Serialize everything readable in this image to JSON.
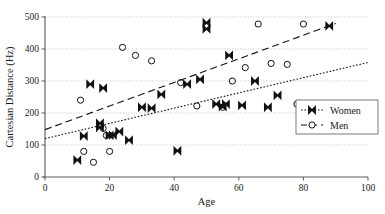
{
  "chart_data": {
    "type": "scatter",
    "title": "",
    "xlabel": "Age",
    "ylabel": "Cartesian Distance (Hz)",
    "xlim": [
      0,
      100
    ],
    "ylim": [
      0,
      500
    ],
    "xticks": [
      0,
      20,
      40,
      60,
      80,
      100
    ],
    "yticks": [
      0,
      100,
      200,
      300,
      400,
      500
    ],
    "grid": "horizontal-dotted",
    "legend_position": "right-middle",
    "series": [
      {
        "name": "Women",
        "marker": "x-cross-filled",
        "line_style": "dotted",
        "color": "#111111",
        "points": [
          [
            10,
            53
          ],
          [
            12,
            128
          ],
          [
            14,
            290
          ],
          [
            17,
            168
          ],
          [
            17,
            155
          ],
          [
            18,
            278
          ],
          [
            20,
            130
          ],
          [
            21,
            131
          ],
          [
            23,
            142
          ],
          [
            26,
            115
          ],
          [
            30,
            218
          ],
          [
            33,
            215
          ],
          [
            36,
            258
          ],
          [
            41,
            82
          ],
          [
            44,
            290
          ],
          [
            48,
            305
          ],
          [
            50,
            482
          ],
          [
            50,
            463
          ],
          [
            53,
            228
          ],
          [
            55,
            220
          ],
          [
            56,
            228
          ],
          [
            57,
            380
          ],
          [
            61,
            224
          ],
          [
            65,
            300
          ],
          [
            69,
            218
          ],
          [
            72,
            255
          ],
          [
            80,
            228
          ],
          [
            88,
            472
          ]
        ],
        "trend_line": {
          "x0": 0,
          "y0": 120,
          "x1": 100,
          "y1": 358
        }
      },
      {
        "name": "Men",
        "marker": "circle-open",
        "line_style": "dashed",
        "color": "#111111",
        "points": [
          [
            11,
            240
          ],
          [
            12,
            80
          ],
          [
            15,
            46
          ],
          [
            18,
            152
          ],
          [
            19,
            130
          ],
          [
            20,
            80
          ],
          [
            24,
            405
          ],
          [
            28,
            380
          ],
          [
            33,
            363
          ],
          [
            42,
            295
          ],
          [
            47,
            222
          ],
          [
            55,
            218
          ],
          [
            58,
            300
          ],
          [
            62,
            342
          ],
          [
            66,
            478
          ],
          [
            70,
            355
          ],
          [
            75,
            352
          ],
          [
            78,
            228
          ],
          [
            80,
            478
          ]
        ],
        "trend_line": {
          "x0": 0,
          "y0": 148,
          "x1": 90,
          "y1": 480
        }
      }
    ]
  },
  "axes": {
    "y_label": "Cartesian Distance (Hz)",
    "x_label": "Age",
    "y_tick_labels": [
      "0",
      "100",
      "200",
      "300",
      "400",
      "500"
    ],
    "x_tick_labels": [
      "0",
      "20",
      "40",
      "60",
      "80",
      "100"
    ]
  },
  "legend": {
    "entries": [
      {
        "label": "Women",
        "marker": "x-cross-filled",
        "line_style": "dotted"
      },
      {
        "label": "Men",
        "marker": "circle-open",
        "line_style": "dashed"
      }
    ]
  }
}
